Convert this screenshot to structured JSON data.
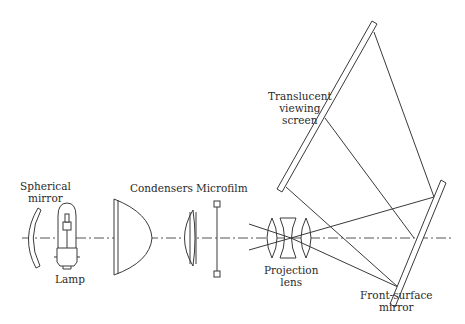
{
  "labels": {
    "spherical_mirror": [
      "Spherical",
      "mirror"
    ],
    "lamp": "Lamp",
    "condensers": "Condensers",
    "microfilm": "Microfilm",
    "projection_lens": [
      "Projection",
      "lens"
    ],
    "screen": [
      "Translucent",
      "viewing",
      "screen"
    ],
    "front_mirror": [
      "Front-surface",
      "mirror"
    ]
  },
  "colors": {
    "stroke": "#3a3a3a",
    "axis": "#555555",
    "background": "#ffffff"
  }
}
